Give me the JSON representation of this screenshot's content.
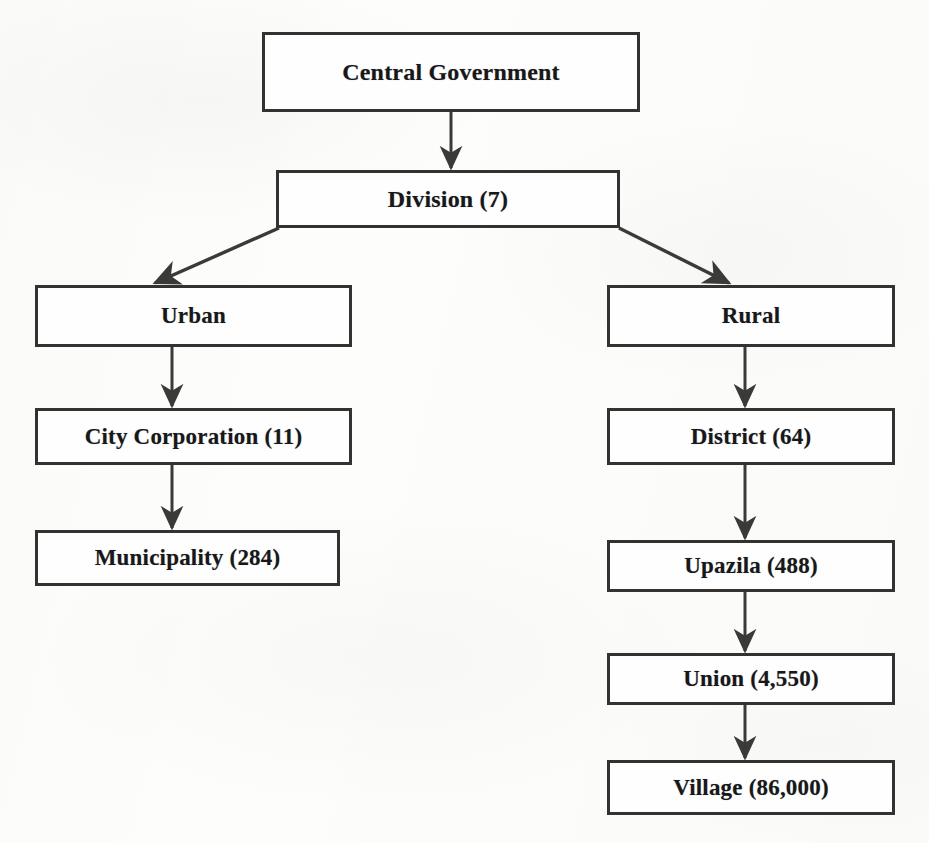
{
  "diagram": {
    "root": {
      "label": "Central Government"
    },
    "level2": {
      "label": "Division (7)"
    },
    "branches": {
      "urban": {
        "label": "Urban",
        "children": [
          {
            "label": "City Corporation (11)"
          },
          {
            "label": "Municipality (284)"
          }
        ]
      },
      "rural": {
        "label": "Rural",
        "children": [
          {
            "label": "District (64)"
          },
          {
            "label": "Upazila (488)"
          },
          {
            "label": "Union (4,550)"
          },
          {
            "label": "Village (86,000)"
          }
        ]
      }
    },
    "colors": {
      "box_border": "#333230",
      "box_fill": "#fefefe",
      "connector": "#3a3a38",
      "text": "#18181a",
      "page_background": "#fdfdfb"
    }
  }
}
